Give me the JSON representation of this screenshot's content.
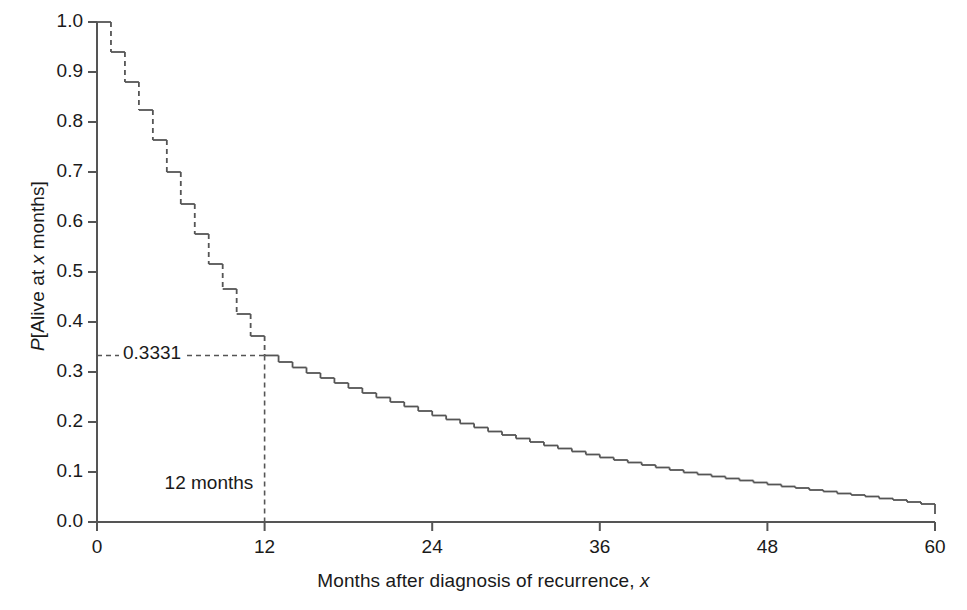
{
  "chart_data": {
    "type": "line",
    "subtype": "kaplan-meier-step",
    "title": "",
    "xlabel_plain": "Months after diagnosis of recurrence, x",
    "xlabel_parts": {
      "text": "Months after diagnosis of recurrence, ",
      "italic": "x"
    },
    "ylabel_plain": "P[Alive at x months]",
    "ylabel_parts": {
      "p": "P",
      "mid": "[Alive at ",
      "x": "x",
      "tail": " months]"
    },
    "xlim": [
      0,
      60
    ],
    "ylim": [
      0.0,
      1.0
    ],
    "xticks": [
      0,
      12,
      24,
      36,
      48,
      60
    ],
    "xtick_labels": [
      "0",
      "12",
      "24",
      "36",
      "48",
      "60"
    ],
    "yticks": [
      0.0,
      0.1,
      0.2,
      0.3,
      0.4,
      0.5,
      0.6,
      0.7,
      0.8,
      0.9,
      1.0
    ],
    "ytick_labels": [
      "0.0",
      "0.1",
      "0.2",
      "0.3",
      "0.4",
      "0.5",
      "0.6",
      "0.7",
      "0.8",
      "0.9",
      "1.0"
    ],
    "grid": false,
    "legend": null,
    "line_color": "#555555",
    "axis_color": "#555555",
    "text_color": "#1a1a1a",
    "dashed_drop_until_month": 12,
    "x": [
      0,
      1,
      2,
      3,
      4,
      5,
      6,
      7,
      8,
      9,
      10,
      11,
      12,
      13,
      14,
      15,
      16,
      17,
      18,
      19,
      20,
      21,
      22,
      23,
      24,
      25,
      26,
      27,
      28,
      29,
      30,
      31,
      32,
      33,
      34,
      35,
      36,
      37,
      38,
      39,
      40,
      41,
      42,
      43,
      44,
      45,
      46,
      47,
      48,
      49,
      50,
      51,
      52,
      53,
      54,
      55,
      56,
      57,
      58,
      59,
      60
    ],
    "y": [
      1.0,
      0.94,
      0.88,
      0.824,
      0.764,
      0.7,
      0.636,
      0.576,
      0.516,
      0.466,
      0.416,
      0.372,
      0.3331,
      0.32,
      0.309,
      0.298,
      0.288,
      0.278,
      0.268,
      0.258,
      0.249,
      0.24,
      0.231,
      0.222,
      0.213,
      0.205,
      0.197,
      0.189,
      0.181,
      0.174,
      0.167,
      0.16,
      0.153,
      0.147,
      0.141,
      0.135,
      0.129,
      0.124,
      0.119,
      0.114,
      0.109,
      0.104,
      0.099,
      0.095,
      0.091,
      0.087,
      0.083,
      0.079,
      0.075,
      0.071,
      0.068,
      0.064,
      0.061,
      0.057,
      0.054,
      0.051,
      0.047,
      0.044,
      0.04,
      0.036,
      0.016
    ],
    "annotations": [
      {
        "name": "survival-at-12-months",
        "label": "0.3331",
        "value": 0.3331,
        "x_month": 12,
        "leader": "dashed-horizontal-from-y-axis"
      },
      {
        "name": "x-marker-12-months",
        "label": "12 months",
        "x_month": 12,
        "leader": "dashed-vertical-to-x-axis"
      }
    ]
  }
}
